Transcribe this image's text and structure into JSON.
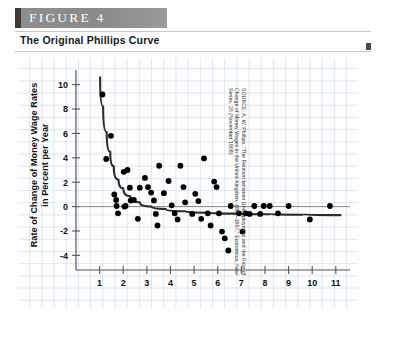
{
  "header": {
    "figure_label": "FIGURE  4",
    "subtitle": "The Original Phillips Curve"
  },
  "source_note": "SOURCE: A. W. Phillips, “The Relation between Unemployment and the Rate of Change of Money Wages in the United Kingdom, 1861–1957,” Economica, New Series, 25 (November 1958).",
  "colors": {
    "banner": "#8d8d8d",
    "banner_tab": "#3a3a3a",
    "grid": "#9ab4d2",
    "point": "#000000",
    "curve": "#2b2b2b",
    "axis": "#555555"
  },
  "chart_data": {
    "type": "scatter",
    "title": "The Original Phillips Curve",
    "xlabel": "Unemployment Rate in Percent",
    "ylabel": "Rate of Change of Money Wage Rates in Percent per Year",
    "xlim": [
      0,
      11.6
    ],
    "ylim": [
      -5.2,
      11.2
    ],
    "xticks": [
      1,
      2,
      3,
      4,
      5,
      6,
      7,
      8,
      9,
      10,
      11
    ],
    "yticks": [
      -4,
      -2,
      0,
      2,
      4,
      6,
      8,
      10
    ],
    "grid": true,
    "legend": "none",
    "zero_line": 0,
    "points": [
      [
        1.12,
        9.2
      ],
      [
        1.48,
        5.8
      ],
      [
        1.28,
        3.9
      ],
      [
        1.62,
        1.0
      ],
      [
        1.7,
        0.55
      ],
      [
        1.72,
        0.05
      ],
      [
        1.78,
        -0.55
      ],
      [
        2.02,
        2.85
      ],
      [
        2.18,
        3.0
      ],
      [
        2.28,
        1.55
      ],
      [
        2.32,
        0.5
      ],
      [
        2.45,
        0.55
      ],
      [
        2.05,
        0.0
      ],
      [
        2.1,
        0.05
      ],
      [
        2.62,
        -1.0
      ],
      [
        2.7,
        1.55
      ],
      [
        2.92,
        2.35
      ],
      [
        3.05,
        1.6
      ],
      [
        3.18,
        1.15
      ],
      [
        3.3,
        0.5
      ],
      [
        3.38,
        -0.6
      ],
      [
        3.45,
        -1.55
      ],
      [
        3.52,
        3.35
      ],
      [
        3.72,
        1.1
      ],
      [
        3.92,
        2.1
      ],
      [
        4.05,
        0.1
      ],
      [
        4.18,
        -0.55
      ],
      [
        4.3,
        -1.05
      ],
      [
        4.42,
        3.35
      ],
      [
        4.55,
        1.6
      ],
      [
        4.62,
        0.35
      ],
      [
        4.92,
        -0.6
      ],
      [
        5.05,
        1.05
      ],
      [
        5.18,
        0.45
      ],
      [
        5.3,
        -1.0
      ],
      [
        5.42,
        3.95
      ],
      [
        5.58,
        -0.55
      ],
      [
        5.7,
        -1.55
      ],
      [
        5.85,
        2.05
      ],
      [
        5.95,
        1.6
      ],
      [
        6.05,
        -0.55
      ],
      [
        6.18,
        -2.05
      ],
      [
        6.3,
        -2.6
      ],
      [
        6.45,
        -3.6
      ],
      [
        6.55,
        0.05
      ],
      [
        6.9,
        -0.55
      ],
      [
        7.05,
        -2.05
      ],
      [
        7.18,
        -0.55
      ],
      [
        7.35,
        -0.6
      ],
      [
        7.55,
        0.05
      ],
      [
        7.8,
        -0.6
      ],
      [
        7.95,
        0.05
      ],
      [
        8.2,
        0.05
      ],
      [
        8.55,
        -0.55
      ],
      [
        9.0,
        0.05
      ],
      [
        9.9,
        -1.05
      ],
      [
        10.75,
        0.05
      ]
    ],
    "fitted_curve": {
      "note": "downward sloping Phillips curve, steep at low unemployment, flattening toward -0.7",
      "points": [
        [
          1.02,
          10.6
        ],
        [
          1.15,
          8.2
        ],
        [
          1.3,
          6.1
        ],
        [
          1.45,
          4.5
        ],
        [
          1.6,
          3.3
        ],
        [
          1.8,
          2.2
        ],
        [
          2.0,
          1.5
        ],
        [
          2.3,
          0.85
        ],
        [
          2.7,
          0.35
        ],
        [
          3.2,
          0.0
        ],
        [
          3.8,
          -0.2
        ],
        [
          4.6,
          -0.38
        ],
        [
          5.6,
          -0.5
        ],
        [
          6.8,
          -0.58
        ],
        [
          8.2,
          -0.63
        ],
        [
          9.6,
          -0.67
        ],
        [
          11.2,
          -0.7
        ]
      ]
    }
  }
}
